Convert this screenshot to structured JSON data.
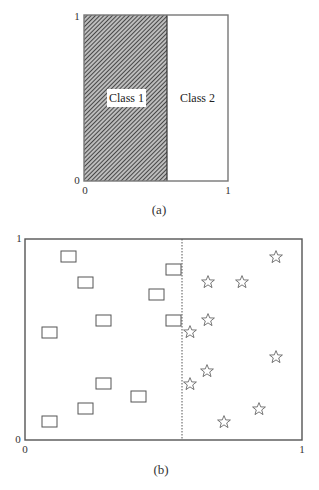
{
  "panel_a": {
    "caption": "(a)",
    "y_tick_top": "1",
    "y_tick_bottom": "0",
    "x_tick_left": "0",
    "x_tick_right": "1",
    "split_fraction": 0.58,
    "region_left_label": "Class 1",
    "region_right_label": "Class 2",
    "region_left_fill": "hatched",
    "region_right_fill": "#ffffff"
  },
  "panel_b": {
    "caption": "(b)",
    "y_tick_top": "1",
    "y_tick_bottom": "0",
    "x_tick_left": "0",
    "x_tick_right": "1",
    "decision_boundary_x": 0.56,
    "boundary_style": "dotted",
    "class_1_marker": "rectangle",
    "class_2_marker": "star",
    "class_1_points": [
      [
        0.15,
        0.91
      ],
      [
        0.22,
        0.78
      ],
      [
        0.06,
        0.54
      ],
      [
        0.28,
        0.59
      ],
      [
        0.46,
        0.69
      ],
      [
        0.53,
        0.82
      ],
      [
        0.53,
        0.59
      ],
      [
        0.28,
        0.26
      ],
      [
        0.42,
        0.2
      ],
      [
        0.22,
        0.14
      ],
      [
        0.06,
        0.09
      ]
    ],
    "class_2_points": [
      [
        0.92,
        0.9
      ],
      [
        0.66,
        0.78
      ],
      [
        0.79,
        0.78
      ],
      [
        0.66,
        0.6
      ],
      [
        0.6,
        0.54
      ],
      [
        0.92,
        0.41
      ],
      [
        0.66,
        0.34
      ],
      [
        0.6,
        0.28
      ],
      [
        0.86,
        0.15
      ],
      [
        0.73,
        0.09
      ]
    ]
  }
}
